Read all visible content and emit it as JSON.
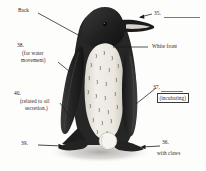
{
  "figure": {
    "background_color": "#fdfdfc",
    "body_dark_color": "#2b2b2b",
    "body_light_color": "#e8e6e0",
    "beak_stripe_color": "#d8d4cb",
    "shadow_color": "#b8b6b2",
    "egg_color": "#f6f4ef",
    "leader_line_color": "#1c1c1c"
  },
  "labels": {
    "back": "Back",
    "white_front": "White front",
    "with_claws": "with claws",
    "item_35": "35.",
    "item_36": "36.",
    "item_37": "37.",
    "item_38": "38.",
    "item_39": "39.",
    "item_40": "40.",
    "hint_38_line1": "(for water",
    "hint_38_line2": "movement)",
    "hint_40_line1": "(related to oil",
    "hint_40_line2": "secretion.)",
    "hint_37": "(incubating)"
  },
  "icons": {
    "arrow_left": "arrow-left-icon",
    "leader_line": "leader-line-icon",
    "answer_blank": "answer-blank-icon"
  }
}
